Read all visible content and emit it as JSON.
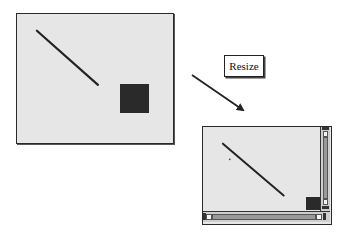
{
  "diagram": {
    "label": "Resize",
    "colors": {
      "window_fill": "#e6e6e6",
      "border": "#2a2a2a",
      "shape_fill": "#2a2a2a",
      "scroll_track": "#9a9a9a",
      "scroll_thumb": "#f5f5f5"
    },
    "windows": [
      {
        "id": "before",
        "scrollbars": false,
        "contents": [
          "diagonal-line",
          "dark-square"
        ]
      },
      {
        "id": "after",
        "scrollbars": true,
        "contents": [
          "diagonal-line",
          "dark-square",
          "small-dot"
        ]
      }
    ],
    "arrow": {
      "direction": "down-right",
      "from": "before",
      "to": "after"
    }
  }
}
